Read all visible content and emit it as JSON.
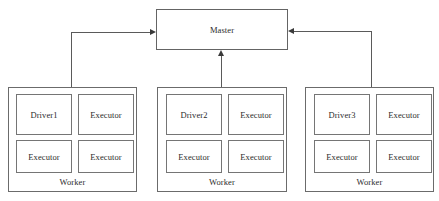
{
  "diagram": {
    "type": "architecture-block-diagram",
    "background_color": "#ffffff",
    "line_color": "#5a5a5a",
    "text_color": "#2b2b2b",
    "master": {
      "label": "Master"
    },
    "workers": [
      {
        "id": "worker-left",
        "label": "Worker",
        "nodes": [
          {
            "label": "Driver1"
          },
          {
            "label": "Executor"
          },
          {
            "label": "Executor"
          },
          {
            "label": "Executor"
          }
        ]
      },
      {
        "id": "worker-middle",
        "label": "Worker",
        "nodes": [
          {
            "label": "Driver2"
          },
          {
            "label": "Executor"
          },
          {
            "label": "Executor"
          },
          {
            "label": "Executor"
          }
        ]
      },
      {
        "id": "worker-right",
        "label": "Worker",
        "nodes": [
          {
            "label": "Driver3"
          },
          {
            "label": "Executor"
          },
          {
            "label": "Executor"
          },
          {
            "label": "Executor"
          }
        ]
      }
    ],
    "connectors": [
      {
        "id": "worker-left-to-master",
        "from": "worker-left",
        "to": "master",
        "arrow": "right"
      },
      {
        "id": "worker-middle-to-master",
        "from": "worker-middle",
        "to": "master",
        "arrow": "up"
      },
      {
        "id": "worker-right-to-master",
        "from": "worker-right",
        "to": "master",
        "arrow": "left"
      }
    ]
  }
}
